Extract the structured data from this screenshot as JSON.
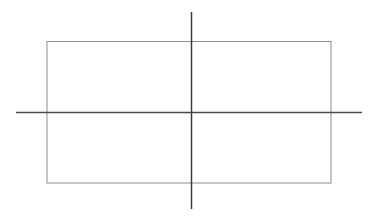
{
  "canvas": {
    "width": 379,
    "height": 219,
    "background_color": "#ffffff",
    "title": "Rectangle with intersecting axes"
  },
  "figure": {
    "type": "line-drawing",
    "shapes": [
      {
        "name": "rectangle",
        "kind": "rect",
        "x": 47,
        "y": 41.5,
        "width": 284,
        "height": 141.5,
        "x2": 331,
        "y2": 183,
        "stroke_color": "#8d8d8d",
        "stroke_width": 1,
        "fill": "none"
      },
      {
        "name": "horizontal-axis-line",
        "kind": "line",
        "x1": 16,
        "y1": 112.5,
        "x2": 362,
        "y2": 112.5,
        "stroke_color": "#4a4a4a",
        "stroke_width": 1.4
      },
      {
        "name": "vertical-axis-line",
        "kind": "line",
        "x1": 191.5,
        "y1": 12,
        "x2": 191.5,
        "y2": 209,
        "stroke_color": "#3a3a3a",
        "stroke_width": 1.5
      }
    ],
    "intersection_point": {
      "name": "axes-intersection",
      "x": 191.5,
      "y": 112.5
    }
  },
  "labels": {
    "visible_text": []
  }
}
